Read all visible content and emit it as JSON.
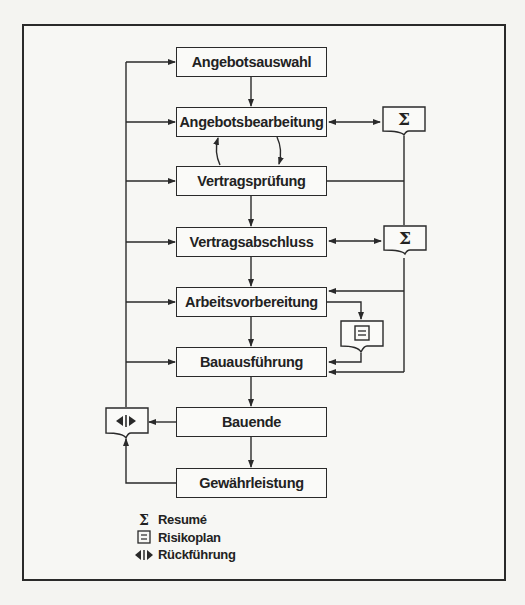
{
  "diagram": {
    "steps": [
      {
        "id": "angebotsauswahl",
        "label": "Angebotsauswahl"
      },
      {
        "id": "angebotsbearbeitung",
        "label": "Angebotsbearbeitung"
      },
      {
        "id": "vertragspruefung",
        "label": "Vertragsprüfung"
      },
      {
        "id": "vertragsabschluss",
        "label": "Vertragsabschluss"
      },
      {
        "id": "arbeitsvorbereitung",
        "label": "Arbeitsvorbereitung"
      },
      {
        "id": "bauausfuehrung",
        "label": "Bauausführung"
      },
      {
        "id": "bauende",
        "label": "Bauende"
      },
      {
        "id": "gewaehrleistung",
        "label": "Gewährleistung"
      }
    ],
    "documents": {
      "resume_1": {
        "symbol": "Σ",
        "type": "Resumé"
      },
      "resume_2": {
        "symbol": "Σ",
        "type": "Resumé"
      },
      "risikoplan": {
        "symbol": "≡",
        "type": "Risikoplan"
      },
      "rueckfuehrung": {
        "symbol": "◀|▶",
        "type": "Rückführung"
      }
    },
    "connections": [
      {
        "from": "Angebotsauswahl",
        "to": "Angebotsbearbeitung"
      },
      {
        "from": "Angebotsbearbeitung",
        "to": "Vertragsprüfung",
        "style": "loop"
      },
      {
        "from": "Vertragsprüfung",
        "to": "Angebotsbearbeitung",
        "style": "loop"
      },
      {
        "from": "Vertragsprüfung",
        "to": "Vertragsabschluss"
      },
      {
        "from": "Vertragsabschluss",
        "to": "Arbeitsvorbereitung"
      },
      {
        "from": "Arbeitsvorbereitung",
        "to": "Bauausführung"
      },
      {
        "from": "Bauausführung",
        "to": "Bauende"
      },
      {
        "from": "Bauende",
        "to": "Gewährleistung"
      },
      {
        "from": "Angebotsbearbeitung",
        "to": "Resumé 1",
        "style": "bidirectional"
      },
      {
        "from": "Vertragsabschluss",
        "to": "Resumé 2",
        "style": "bidirectional"
      },
      {
        "from": "Arbeitsvorbereitung",
        "to": "Risikoplan"
      },
      {
        "from": "Risikoplan",
        "to": "Bauausführung"
      },
      {
        "from": "Bauende",
        "to": "Rückführung"
      },
      {
        "from": "Gewährleistung",
        "to": "Rückführung"
      },
      {
        "from": "Rückführung",
        "to": "all phases"
      }
    ]
  },
  "legend": {
    "items": [
      {
        "symbol": "Σ",
        "label": "Resumé"
      },
      {
        "symbol": "≡",
        "label": "Risikoplan"
      },
      {
        "symbol": "◀|▶",
        "label": "Rückführung"
      }
    ]
  }
}
